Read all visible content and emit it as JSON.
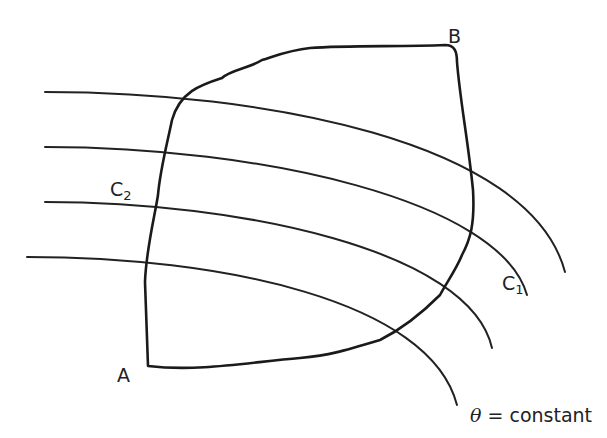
{
  "diagram": {
    "stroke_color": "#222222",
    "background": "#ffffff",
    "labels": {
      "point_a": "A",
      "point_b": "B",
      "curve_c1": "C",
      "curve_c1_sub": "1",
      "curve_c2": "C",
      "curve_c2_sub": "2",
      "theta_symbol": "θ",
      "theta_rest": " = constant"
    },
    "level_curves": [
      {
        "name": "curve-1",
        "d": "M 45 92 C 260 92, 530 140, 565 272"
      },
      {
        "name": "curve-2-c1",
        "d": "M 45 147 C 260 147, 500 200, 527 295"
      },
      {
        "name": "curve-3-c2",
        "d": "M 45 202 C 240 202, 470 250, 492 348"
      },
      {
        "name": "curve-4-theta",
        "d": "M 27 257 C 220 257, 430 300, 457 405"
      }
    ],
    "region_path": "M 148 366 L 145 282 C 146 250, 155 215, 158 195 C 160 170, 168 140, 172 120 C 180 92, 200 85, 222 78 C 230 70, 250 68, 262 60 C 278 55, 290 50, 310 48 C 350 45, 400 47, 445 45 C 455 45, 457 52, 457 62 C 460 100, 468 140, 473 190 C 475 225, 470 240, 462 255 C 456 270, 445 285, 440 295 C 420 315, 400 330, 380 340 C 340 352, 330 355, 300 358 C 250 362, 200 372, 148 366 Z"
  }
}
